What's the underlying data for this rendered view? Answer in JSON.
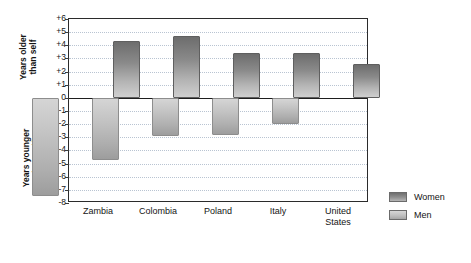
{
  "chart_data": {
    "type": "bar",
    "title": "",
    "subtitle": "",
    "xlabel": "",
    "ylabel": "",
    "axis_captions": {
      "positive": "Years older\nthan self",
      "negative": "Years younger\nthan self"
    },
    "categories": [
      "Zambia",
      "Colombia",
      "Poland",
      "Italy",
      "United\nStates"
    ],
    "series": [
      {
        "name": "Women",
        "values": [
          4.3,
          4.7,
          3.4,
          3.4,
          2.6
        ],
        "color": "#8a8a8a"
      },
      {
        "name": "Men",
        "values": [
          -7.5,
          -4.7,
          -2.9,
          -2.85,
          -2.0
        ],
        "color": "#c2c2c2"
      }
    ],
    "ylim": [
      -8,
      6
    ],
    "y_ticks": [
      {
        "value": 6,
        "label": "+6"
      },
      {
        "value": 5,
        "label": "+5"
      },
      {
        "value": 4,
        "label": "+4"
      },
      {
        "value": 3,
        "label": "+3"
      },
      {
        "value": 2,
        "label": "+2"
      },
      {
        "value": 1,
        "label": "+1"
      },
      {
        "value": 0,
        "label": "0"
      },
      {
        "value": -1,
        "label": "-1"
      },
      {
        "value": -2,
        "label": "-2"
      },
      {
        "value": -3,
        "label": "-3"
      },
      {
        "value": -4,
        "label": "-4"
      },
      {
        "value": -5,
        "label": "-5"
      },
      {
        "value": -6,
        "label": "-6"
      },
      {
        "value": -7,
        "label": "-7"
      },
      {
        "value": -8,
        "label": "-8"
      }
    ],
    "grid": true,
    "zero_line": true,
    "legend_position": "right",
    "legend": [
      {
        "label": "Women",
        "swatch": "sw-women"
      },
      {
        "label": "Men",
        "swatch": "sw-men"
      }
    ]
  }
}
